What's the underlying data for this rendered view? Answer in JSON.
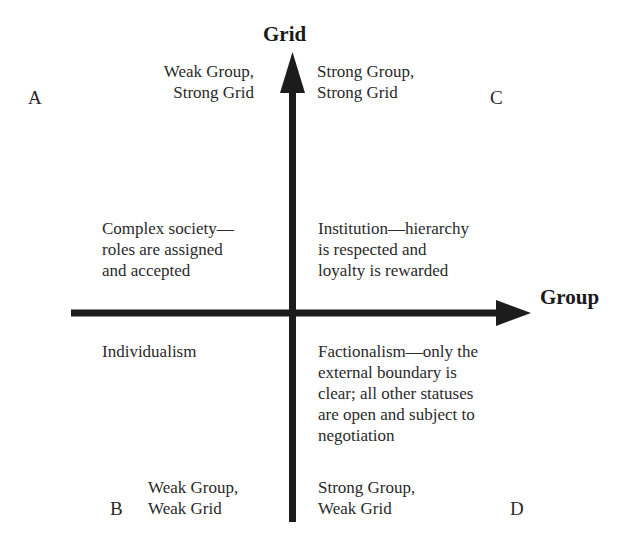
{
  "axes": {
    "vertical": {
      "label": "Grid"
    },
    "horizontal": {
      "label": "Group"
    },
    "color": "#1c1c1c"
  },
  "quadrants": {
    "A": {
      "letter": "A",
      "title": "Weak Group,\nStrong Grid",
      "description": "Complex society—\nroles are assigned\nand accepted"
    },
    "C": {
      "letter": "C",
      "title": "Strong Group,\nStrong Grid",
      "description": "Institution—hierarchy\nis respected and\nloyalty is rewarded"
    },
    "B": {
      "letter": "B",
      "title": "Weak Group,\nWeak Grid",
      "description": "Individualism"
    },
    "D": {
      "letter": "D",
      "title": "Strong Group,\nWeak Grid",
      "description": "Factionalism—only the\nexternal boundary is\nclear; all other statuses\nare open and subject to\nnegotiation"
    }
  }
}
